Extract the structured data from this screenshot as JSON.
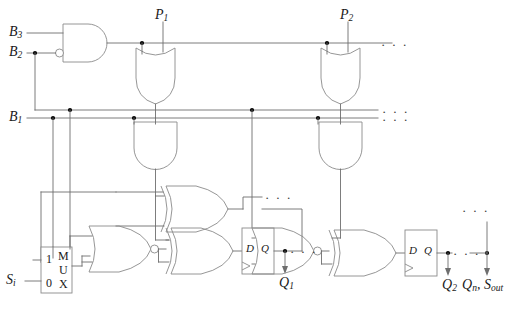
{
  "figure": {
    "kind": "logic-circuit-schematic"
  },
  "signals": {
    "b3": {
      "base": "B",
      "sub": "3"
    },
    "b2": {
      "base": "B",
      "sub": "2"
    },
    "b1": {
      "base": "B",
      "sub": "1"
    },
    "p1": {
      "base": "P",
      "sub": "1"
    },
    "p2": {
      "base": "P",
      "sub": "2"
    },
    "si": {
      "base": "S",
      "sub": "i"
    },
    "q1": {
      "base": "Q",
      "sub": "1"
    },
    "q2": {
      "base": "Q",
      "sub": "2"
    },
    "qn_sout": {
      "text": "Q",
      "sub": "n",
      "tail": ", S",
      "tail_sub": "out"
    }
  },
  "mux": {
    "input_top_label": "1",
    "input_bottom_label": "0",
    "name_chars": [
      "M",
      "U",
      "X"
    ]
  },
  "flipflops": [
    {
      "id": "ff1",
      "d_label": "D",
      "q_label": "Q",
      "out_signal": "Q1"
    },
    {
      "id": "ff2",
      "d_label": "D",
      "q_label": "Q",
      "out_signal": "Q2"
    }
  ],
  "ellipses": {
    "top_row": "· · ·",
    "bus_upper": "· · ·",
    "bus_lower": "· · ·",
    "mid_right": "· · ·",
    "q1_right": "· · ·",
    "q2_right": "· · ·",
    "top_far_right": "· · ·"
  },
  "colors": {
    "wire": "#6e6e6e",
    "gate_outline": "#8a8a8a",
    "junction": "#000000",
    "text": "#1a1a1a",
    "background": "#ffffff"
  }
}
